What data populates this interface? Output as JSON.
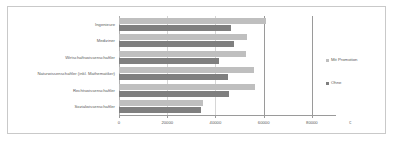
{
  "chart_data": {
    "type": "bar",
    "orientation": "horizontal",
    "title": "",
    "xlabel": "€",
    "ylabel": "",
    "xlim": [
      0,
      90000
    ],
    "grid": true,
    "legend_position": "right",
    "xticks": [
      "0",
      "20000",
      "40000",
      "60000",
      "80000"
    ],
    "xtick_values": [
      0,
      20000,
      40000,
      60000,
      80000
    ],
    "unit": "€",
    "categories": [
      "Ingenieure",
      "Mediziner",
      "Wirtschaftswissenschaftler",
      "Naturwissenschaftler (inkl. Mathematiker)",
      "Rechtswissenschaftler",
      "Sozialwissenschaftler"
    ],
    "series": [
      {
        "name": "Mit Promotion",
        "color": "#bfbfbf",
        "values": [
          61000,
          53000,
          52800,
          56000,
          56500,
          35000
        ]
      },
      {
        "name": "Ohne",
        "color": "#7f7f7f",
        "values": [
          46500,
          47500,
          41500,
          45000,
          45500,
          34000
        ]
      }
    ]
  },
  "legend": {
    "entries": [
      {
        "label": "Mit Promotion"
      },
      {
        "label": "Ohne"
      }
    ]
  }
}
